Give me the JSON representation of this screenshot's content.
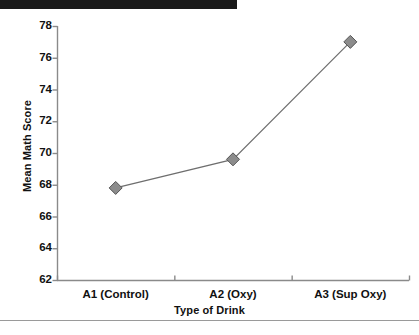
{
  "chart_data": {
    "type": "line",
    "title": "",
    "subtitle": "",
    "xlabel": "Type of Drink",
    "ylabel": "Mean Math Score",
    "categories": [
      "A1 (Control)",
      "A2 (Oxy)",
      "A3 (Sup Oxy)"
    ],
    "values": [
      67.8,
      69.6,
      77.0
    ],
    "series": [
      {
        "name": "Mean Math Score",
        "values": [
          67.8,
          69.6,
          77.0
        ]
      }
    ],
    "ylim": [
      62,
      78
    ],
    "yticks": [
      62,
      64,
      66,
      68,
      70,
      72,
      74,
      76,
      78
    ],
    "ytick_labels": [
      "62",
      "64",
      "66",
      "68",
      "70",
      "72",
      "74",
      "76",
      "78"
    ],
    "grid": false,
    "legend": "none",
    "marker": "diamond",
    "marker_color": "#8c8c8c",
    "marker_edge_color": "#555555",
    "line_color": "#6e6e6e",
    "axis_color": "#8a8a8a",
    "text_color": "#111111",
    "background": "#ffffff"
  },
  "figure": {
    "y_axis_title": "Mean Math Score",
    "x_axis_title": "Type of Drink"
  },
  "artifacts": {
    "scan_bar_color": "#1a1a1a",
    "page_rule_color": "#9a9a9a"
  }
}
